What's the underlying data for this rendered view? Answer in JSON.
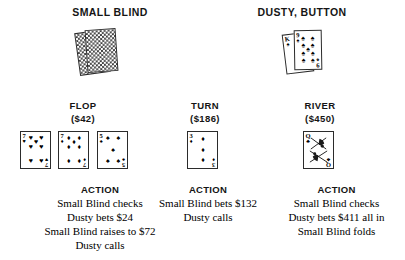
{
  "players": [
    {
      "name": "SMALL BLIND",
      "cards_hidden": true,
      "card_back_count": 2,
      "cards": []
    },
    {
      "name": "DUSTY, BUTTON",
      "cards_hidden": false,
      "cards": [
        {
          "rank": "K",
          "suit": "spade",
          "suit_glyph": "♠",
          "color": "#000000"
        },
        {
          "rank": "9",
          "suit": "spade",
          "suit_glyph": "♠",
          "color": "#000000"
        }
      ]
    }
  ],
  "streets": [
    {
      "title": "FLOP",
      "pot": "($42)",
      "cards": [
        {
          "rank": "7",
          "suit": "heart",
          "suit_glyph": "♥",
          "color": "#000000"
        },
        {
          "rank": "7",
          "suit": "diamond",
          "suit_glyph": "♦",
          "color": "#000000"
        },
        {
          "rank": "5",
          "suit": "spade",
          "suit_glyph": "♠",
          "color": "#000000"
        }
      ]
    },
    {
      "title": "TURN",
      "pot": "($186)",
      "cards": [
        {
          "rank": "3",
          "suit": "diamond",
          "suit_glyph": "♦",
          "color": "#000000"
        }
      ]
    },
    {
      "title": "RIVER",
      "pot": "($450)",
      "cards": [
        {
          "rank": "Q",
          "suit": "club",
          "suit_glyph": "♣",
          "color": "#000000"
        }
      ]
    }
  ],
  "actions": [
    {
      "title": "ACTION",
      "lines": [
        "Small Blind checks",
        "Dusty bets $24",
        "Small Blind raises to $72",
        "Dusty calls"
      ]
    },
    {
      "title": "ACTION",
      "lines": [
        "Small Blind bets $132",
        "Dusty calls"
      ]
    },
    {
      "title": "ACTION",
      "lines": [
        "Small Blind checks",
        "Dusty bets $411 all in",
        "Small Blind folds"
      ]
    }
  ],
  "colors": {
    "ink": "#000000",
    "heading": "#151515",
    "card_border": "#2b2b2b",
    "card_back_pattern": "#3c3c3c",
    "page_background": "#ffffff"
  }
}
